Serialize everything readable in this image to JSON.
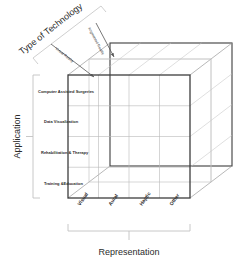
{
  "diagram": {
    "title_hidden": "",
    "axes": {
      "x_axis_label": "Representation",
      "y_axis_label": "Application",
      "z_axis_label": "Type of Technology"
    },
    "x_categories": [
      "Visual",
      "Aural",
      "Haptic",
      "Other"
    ],
    "y_categories": [
      "Computer Assisted Surgeries",
      "Data Visualization",
      "Rehabilitation & Therapy",
      "Training &Education"
    ],
    "z_categories": [
      "Virtual Reality",
      "Augmented Reality"
    ],
    "colors": {
      "front_face_stroke": "#3d3d3d",
      "grid_stroke": "#b9b9b9",
      "depth_stroke": "#8f8f8f",
      "bracket_stroke": "#c2c2c2",
      "text": "#2b2b2b",
      "arrow": "#555555",
      "background": "#ffffff"
    },
    "grid": {
      "columns": 4,
      "rows": 4,
      "depth_layers": 2
    }
  }
}
